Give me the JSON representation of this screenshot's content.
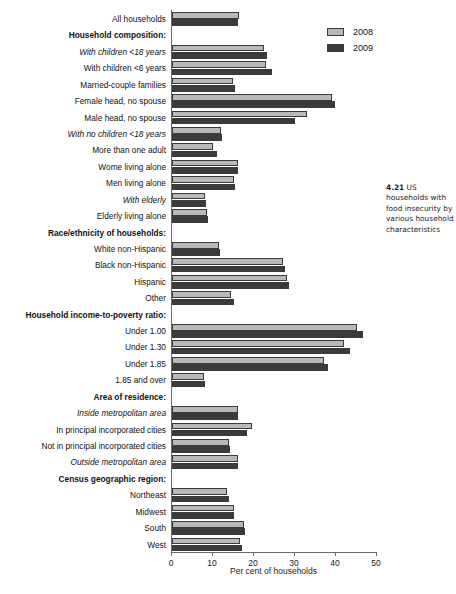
{
  "figure": {
    "caption_number": "4.21",
    "caption_text": "US households with food insecurity by various household characteristics"
  },
  "legend": {
    "position": "top-right",
    "items": [
      {
        "label": "2008",
        "color": "#b9b9b9",
        "name": "series-2008"
      },
      {
        "label": "2009",
        "color": "#3b3b3b",
        "name": "series-2009"
      }
    ]
  },
  "axis": {
    "xlabel": "Per cent of households",
    "ticks": [
      "0",
      "10",
      "20",
      "30",
      "40",
      "50"
    ]
  },
  "chart_data": {
    "type": "bar",
    "orientation": "horizontal",
    "title": "US households with food insecurity by various household characteristics",
    "xlabel": "Per cent of households",
    "ylabel": "",
    "xlim": [
      0,
      50
    ],
    "grid": false,
    "legend_position": "top-right",
    "categories": [
      "All households",
      "Household composition:",
      "With children <18 years",
      "With children <6 years",
      "Married-couple families",
      "Female head, no spouse",
      "Male head, no spouse",
      "With no children <18 years",
      "More than one adult",
      "Wome living alone",
      "Men living alone",
      "With elderly",
      "Elderly living alone",
      "Race/ethnicity of households:",
      "White non-Hispanic",
      "Black non-Hispanic",
      "Hispanic",
      "Other",
      "Household income-to-poverty ratio:",
      "Under 1.00",
      "Under 1.30",
      "Under 1.85",
      "1.85 and over",
      "Area of residence:",
      "Inside metropolitan area",
      "In principal incorporated cities",
      "Not in principal incorporated cities",
      "Outside metropolitan area",
      "Census geographic region:",
      "Northeast",
      "Midwest",
      "South",
      "West"
    ],
    "series": [
      {
        "name": "2008",
        "values": [
          16.3,
          null,
          22.5,
          23.0,
          14.8,
          39.0,
          33.0,
          12.0,
          10.0,
          16.0,
          15.2,
          8.0,
          8.5,
          null,
          11.5,
          27.0,
          28.0,
          14.5,
          null,
          45.0,
          42.0,
          37.0,
          7.8,
          null,
          16.0,
          19.5,
          13.8,
          16.0,
          null,
          13.5,
          15.0,
          17.5,
          16.5
        ]
      },
      {
        "name": "2009",
        "values": [
          16.2,
          null,
          23.2,
          24.3,
          15.4,
          39.7,
          30.0,
          12.2,
          11.0,
          16.2,
          15.3,
          8.3,
          8.8,
          null,
          11.8,
          27.5,
          28.5,
          15.0,
          null,
          46.5,
          43.5,
          38.0,
          8.0,
          null,
          16.0,
          18.2,
          14.2,
          16.0,
          null,
          13.8,
          15.2,
          17.8,
          17.0
        ]
      }
    ],
    "rows": [
      {
        "label": "All households",
        "style": "plain",
        "v2008": 16.3,
        "v2009": 16.2
      },
      {
        "label": "Household composition:",
        "style": "header",
        "v2008": null,
        "v2009": null
      },
      {
        "label": "With children <18 years",
        "style": "italic",
        "v2008": 22.5,
        "v2009": 23.2
      },
      {
        "label": "With children <6 years",
        "style": "plain",
        "v2008": 23.0,
        "v2009": 24.3
      },
      {
        "label": "Married-couple families",
        "style": "plain",
        "v2008": 14.8,
        "v2009": 15.4
      },
      {
        "label": "Female head, no spouse",
        "style": "plain",
        "v2008": 39.0,
        "v2009": 39.7
      },
      {
        "label": "Male head, no spouse",
        "style": "plain",
        "v2008": 33.0,
        "v2009": 30.0
      },
      {
        "label": "With no children <18 years",
        "style": "italic",
        "v2008": 12.0,
        "v2009": 12.2
      },
      {
        "label": "More than one adult",
        "style": "plain",
        "v2008": 10.0,
        "v2009": 11.0
      },
      {
        "label": "Wome living alone",
        "style": "plain",
        "v2008": 16.0,
        "v2009": 16.2
      },
      {
        "label": "Men living alone",
        "style": "plain",
        "v2008": 15.2,
        "v2009": 15.3
      },
      {
        "label": "With elderly",
        "style": "italic",
        "v2008": 8.0,
        "v2009": 8.3
      },
      {
        "label": "Elderly living alone",
        "style": "plain",
        "v2008": 8.5,
        "v2009": 8.8
      },
      {
        "label": "Race/ethnicity of households:",
        "style": "header",
        "v2008": null,
        "v2009": null
      },
      {
        "label": "White non-Hispanic",
        "style": "plain",
        "v2008": 11.5,
        "v2009": 11.8
      },
      {
        "label": "Black non-Hispanic",
        "style": "plain",
        "v2008": 27.0,
        "v2009": 27.5
      },
      {
        "label": "Hispanic",
        "style": "plain",
        "v2008": 28.0,
        "v2009": 28.5
      },
      {
        "label": "Other",
        "style": "plain",
        "v2008": 14.5,
        "v2009": 15.0
      },
      {
        "label": "Household income-to-poverty ratio:",
        "style": "header",
        "v2008": null,
        "v2009": null
      },
      {
        "label": "Under 1.00",
        "style": "plain",
        "v2008": 45.0,
        "v2009": 46.5
      },
      {
        "label": "Under 1.30",
        "style": "plain",
        "v2008": 42.0,
        "v2009": 43.5
      },
      {
        "label": "Under 1.85",
        "style": "plain",
        "v2008": 37.0,
        "v2009": 38.0
      },
      {
        "label": "1.85 and over",
        "style": "plain",
        "v2008": 7.8,
        "v2009": 8.0
      },
      {
        "label": "Area of residence:",
        "style": "header",
        "v2008": null,
        "v2009": null
      },
      {
        "label": "Inside metropolitan area",
        "style": "italic",
        "v2008": 16.0,
        "v2009": 16.0
      },
      {
        "label": "In principal incorporated cities",
        "style": "plain",
        "v2008": 19.5,
        "v2009": 18.2
      },
      {
        "label": "Not in principal incorporated cities",
        "style": "plain",
        "v2008": 13.8,
        "v2009": 14.2
      },
      {
        "label": "Outside metropolitan area",
        "style": "italic",
        "v2008": 16.0,
        "v2009": 16.0
      },
      {
        "label": "Census geographic region:",
        "style": "header",
        "v2008": null,
        "v2009": null
      },
      {
        "label": "Northeast",
        "style": "plain",
        "v2008": 13.5,
        "v2009": 13.8
      },
      {
        "label": "Midwest",
        "style": "plain",
        "v2008": 15.0,
        "v2009": 15.2
      },
      {
        "label": "South",
        "style": "plain",
        "v2008": 17.5,
        "v2009": 17.8
      },
      {
        "label": "West",
        "style": "plain",
        "v2008": 16.5,
        "v2009": 17.0
      }
    ]
  }
}
